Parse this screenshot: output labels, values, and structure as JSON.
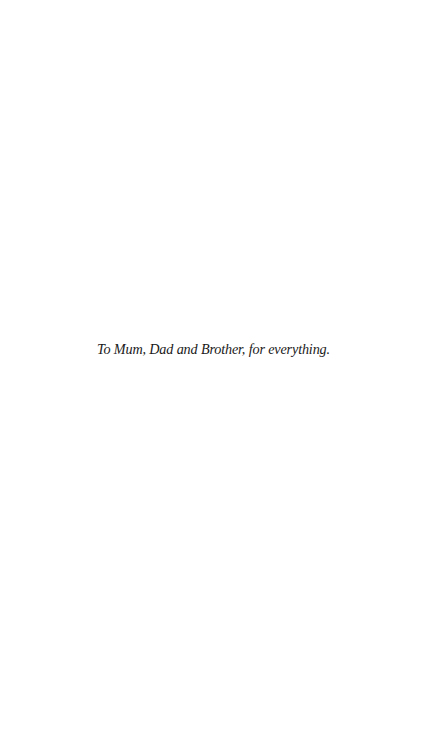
{
  "page": {
    "background": "#ffffff",
    "dedication": "To Mum, Dad and Brother, for everything."
  }
}
